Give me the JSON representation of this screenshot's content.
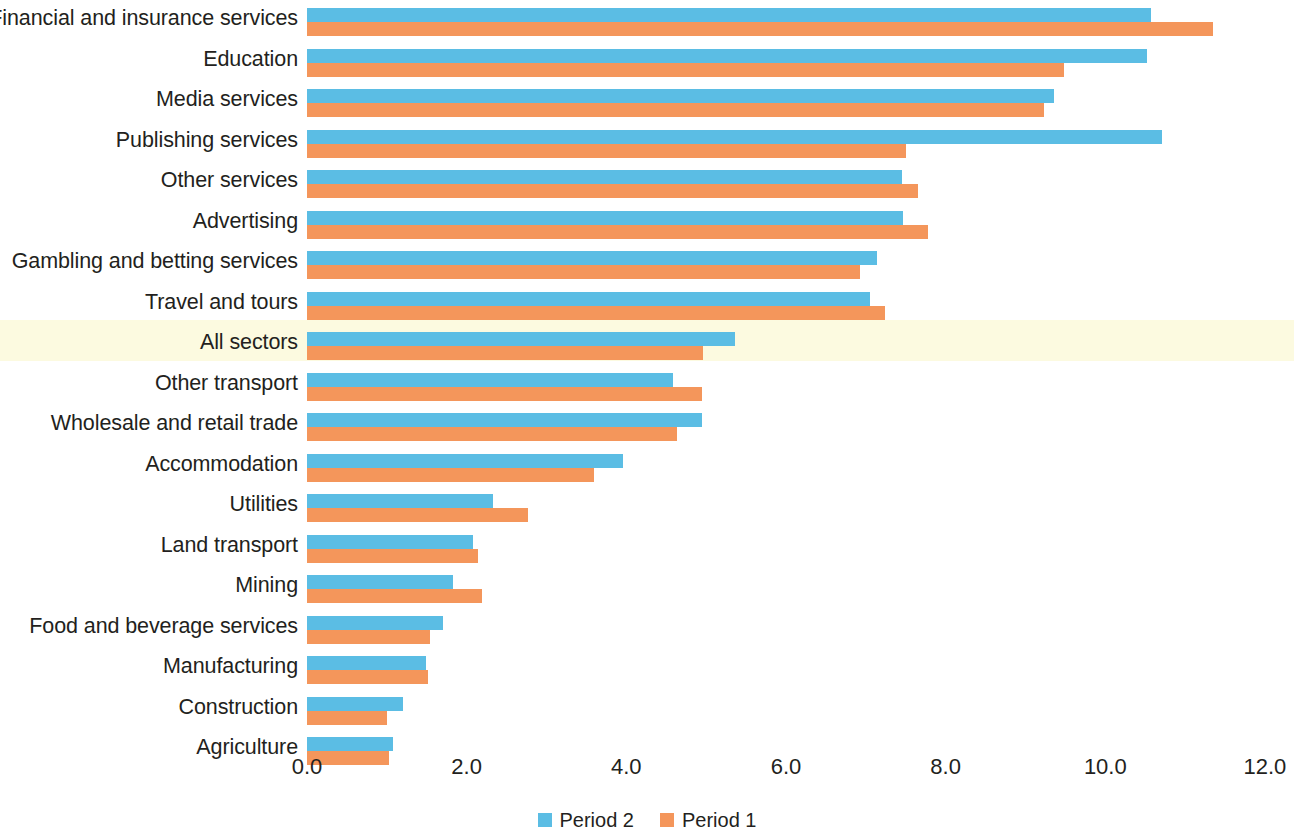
{
  "chart_data": {
    "type": "bar",
    "orientation": "horizontal",
    "title": "",
    "subtitle": "",
    "xlabel": "",
    "ylabel": "",
    "xlim": [
      0.0,
      12.0
    ],
    "xticks": [
      "0.0",
      "2.0",
      "4.0",
      "6.0",
      "8.0",
      "10.0",
      "12.0"
    ],
    "xtick_values": [
      0.0,
      2.0,
      4.0,
      6.0,
      8.0,
      10.0,
      12.0
    ],
    "grid": false,
    "legend_position": "bottom-center",
    "highlight_category": "All sectors",
    "highlight_color": "#FCFAE0",
    "categories": [
      "Financial and insurance services",
      "Education",
      "Media services",
      "Publishing services",
      "Other services",
      "Advertising",
      "Gambling and betting services",
      "Travel and tours",
      "All sectors",
      "Other transport",
      "Wholesale and retail trade",
      "Accommodation",
      "Utilities",
      "Land transport",
      "Mining",
      "Food and beverage services",
      "Manufacturing",
      "Construction",
      "Agriculture"
    ],
    "series": [
      {
        "name": "Period 2",
        "color": "#5BBDE4",
        "values": [
          10.57,
          10.52,
          9.36,
          10.71,
          7.45,
          7.46,
          7.14,
          7.05,
          5.36,
          4.58,
          4.95,
          3.96,
          2.33,
          2.08,
          1.83,
          1.7,
          1.49,
          1.2,
          1.08
        ]
      },
      {
        "name": "Period 1",
        "color": "#F4965B",
        "values": [
          11.35,
          9.48,
          9.23,
          7.5,
          7.65,
          7.78,
          6.93,
          7.24,
          4.96,
          4.95,
          4.63,
          3.6,
          2.77,
          2.14,
          2.19,
          1.54,
          1.51,
          1.0,
          1.03
        ]
      }
    ]
  },
  "legend": {
    "items": [
      {
        "label": "Period 2",
        "color": "#5BBDE4"
      },
      {
        "label": "Period 1",
        "color": "#F4965B"
      }
    ]
  }
}
